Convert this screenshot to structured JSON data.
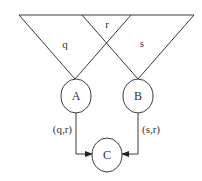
{
  "diagram": {
    "region_labels": {
      "left": "q",
      "middle": "r",
      "right": "s"
    },
    "nodes": [
      {
        "id": "A",
        "label": "A"
      },
      {
        "id": "B",
        "label": "B"
      },
      {
        "id": "C",
        "label": "C"
      }
    ],
    "edges": [
      {
        "from": "A",
        "to": "C",
        "label": "(q,r)"
      },
      {
        "from": "B",
        "to": "C",
        "label": "(s,r)"
      }
    ],
    "colors": {
      "stroke": "#3a3a3a",
      "text": "#333333",
      "background": "#ffffff"
    }
  }
}
